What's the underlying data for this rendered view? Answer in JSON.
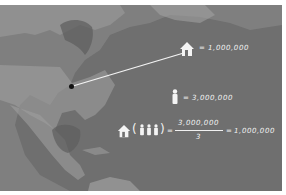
{
  "infographic": {
    "house_label": {
      "equals": "=",
      "value": "1,000,000"
    },
    "person_label": {
      "equals": "=",
      "value": "3,000,000"
    },
    "equation": {
      "open_paren": "(",
      "close_paren": ")",
      "equals1": "=",
      "numerator": "3,000,000",
      "denominator": "3",
      "equals2": "=",
      "result": "1,000,000"
    },
    "icons": [
      "house-icon",
      "person-icon",
      "location-marker-icon"
    ],
    "colors": {
      "background": "#6f6f6f",
      "land": "#9a9a9a",
      "text": "#f2f2f2",
      "border": "#ffffff"
    }
  }
}
